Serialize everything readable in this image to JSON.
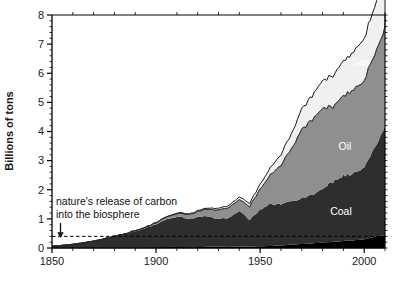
{
  "chart_data": {
    "type": "area",
    "title": "",
    "subtitle": "",
    "xlabel": "",
    "ylabel": "Billions of tons",
    "xlim": [
      1850,
      2010
    ],
    "ylim": [
      0,
      8
    ],
    "grid": false,
    "legend_position": "inline-labels",
    "stacked": true,
    "x_ticks_major": [
      "1850",
      "1900",
      "1950",
      "2000"
    ],
    "x_tick_major_values": [
      1850,
      1900,
      1950,
      2000
    ],
    "x_tick_minor_step": 10,
    "y_ticks": [
      "0",
      "1",
      "2",
      "3",
      "4",
      "5",
      "6",
      "7",
      "8"
    ],
    "y_tick_values": [
      0,
      1,
      2,
      3,
      4,
      5,
      6,
      7,
      8
    ],
    "y_tick_minor_step": 0.2,
    "colors": {
      "cement_flaring": "#000000",
      "coal": "#2e2e2e",
      "oil": "#8f8f8f",
      "gas": "#f0f0f0",
      "outline": "#000000",
      "axis": "#000000",
      "text": "#1a1a1a",
      "series_label_text": "#ffffff",
      "reference_line": "#000000"
    },
    "reference_line": {
      "label_line_1": "nature's release of carbon",
      "label_line_2": "into the biosphere",
      "value": 0.4,
      "style": "dashed",
      "arrow": "down-arrow"
    },
    "x": [
      1850,
      1855,
      1860,
      1865,
      1870,
      1875,
      1880,
      1885,
      1890,
      1895,
      1900,
      1905,
      1910,
      1915,
      1920,
      1925,
      1930,
      1935,
      1940,
      1945,
      1950,
      1955,
      1960,
      1965,
      1970,
      1975,
      1980,
      1985,
      1990,
      1995,
      2000,
      2005,
      2010
    ],
    "series": [
      {
        "name": "Other",
        "label": "",
        "color": "#000000",
        "values": [
          0.01,
          0.01,
          0.01,
          0.01,
          0.01,
          0.02,
          0.02,
          0.02,
          0.02,
          0.02,
          0.03,
          0.03,
          0.03,
          0.03,
          0.03,
          0.04,
          0.04,
          0.04,
          0.05,
          0.05,
          0.06,
          0.07,
          0.09,
          0.11,
          0.14,
          0.16,
          0.19,
          0.21,
          0.24,
          0.26,
          0.3,
          0.38,
          0.45
        ]
      },
      {
        "name": "Coal",
        "label": "Coal",
        "color": "#2e2e2e",
        "values": [
          0.05,
          0.08,
          0.12,
          0.17,
          0.23,
          0.3,
          0.38,
          0.46,
          0.56,
          0.66,
          0.79,
          0.95,
          1.05,
          0.98,
          1.02,
          1.06,
          0.94,
          1.0,
          1.22,
          0.92,
          1.26,
          1.44,
          1.41,
          1.49,
          1.56,
          1.66,
          1.86,
          2.06,
          2.25,
          2.3,
          2.48,
          3.1,
          3.7
        ]
      },
      {
        "name": "Oil",
        "label": "Oil",
        "color": "#8f8f8f",
        "values": [
          0.0,
          0.0,
          0.0,
          0.0,
          0.0,
          0.0,
          0.01,
          0.01,
          0.02,
          0.03,
          0.05,
          0.08,
          0.11,
          0.14,
          0.19,
          0.25,
          0.31,
          0.35,
          0.4,
          0.45,
          0.7,
          1.0,
          1.35,
          1.78,
          2.4,
          2.56,
          2.8,
          2.55,
          2.75,
          2.85,
          3.0,
          3.2,
          3.4
        ]
      },
      {
        "name": "Gas",
        "label": "Gas",
        "color": "#f0f0f0",
        "values": [
          0.0,
          0.0,
          0.0,
          0.0,
          0.0,
          0.0,
          0.0,
          0.0,
          0.0,
          0.0,
          0.01,
          0.01,
          0.02,
          0.02,
          0.03,
          0.04,
          0.06,
          0.07,
          0.09,
          0.11,
          0.17,
          0.24,
          0.37,
          0.51,
          0.72,
          0.83,
          0.95,
          1.05,
          1.2,
          1.3,
          1.45,
          1.62,
          1.85
        ]
      }
    ]
  },
  "axes": {
    "y_axis_label": "Billions of tons"
  }
}
